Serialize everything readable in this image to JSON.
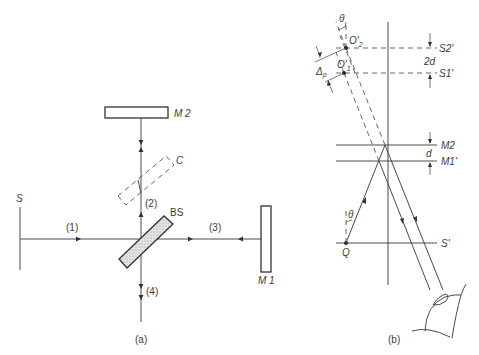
{
  "figure": {
    "panel_a": {
      "caption": "(a)",
      "labels": {
        "source": "S",
        "mirror2": "M 2",
        "mirror1": "M 1",
        "compensator": "C",
        "beamsplitter": "BS",
        "beam1": "(1)",
        "beam2": "(2)",
        "beam3": "(3)",
        "beam4": "(4)"
      }
    },
    "panel_b": {
      "caption": "(b)",
      "labels": {
        "theta_top": "θ",
        "o2": "O'",
        "o2_sub": "2",
        "o1": "O'",
        "o1_sub": "1",
        "delta": "Δ",
        "delta_sub": "p",
        "s2": "S2'",
        "s1": "S1'",
        "two_d": "2d",
        "m2": "M2",
        "d": "d",
        "m1": "M1'",
        "theta_bottom": "θ",
        "q": "Q",
        "s_prime": "S'"
      }
    },
    "colors": {
      "line": "#4a4a4a",
      "text": "#3a3a3a",
      "hatch": "#bdbdbd"
    }
  }
}
